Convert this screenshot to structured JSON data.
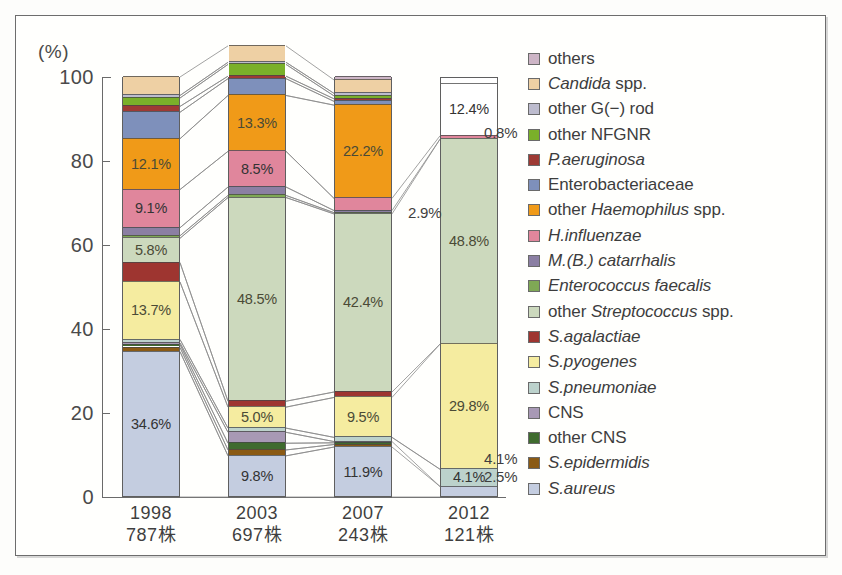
{
  "axis": {
    "unit_label": "(%)",
    "yticks": [
      "100",
      "80",
      "60",
      "40",
      "20",
      "0"
    ],
    "ymin": 0,
    "ymax": 100
  },
  "chart_data": {
    "type": "bar",
    "title": "",
    "subtitle": "",
    "xlabel": "",
    "ylabel": "(%)",
    "ylim": [
      0,
      100
    ],
    "grid": false,
    "legend_position": "right",
    "stacked": true,
    "stack_note": "100% stacked column chart; 2012 column total plotted is 87.6% with 12.4% unfilled/white area at top",
    "categories": [
      "1998",
      "2003",
      "2007",
      "2012"
    ],
    "category_sublabels": [
      "787株",
      "697株",
      "243株",
      "121株"
    ],
    "series": [
      {
        "name": "S.aureus",
        "color": "#c4cde0",
        "values": [
          34.6,
          9.8,
          11.9,
          2.5
        ],
        "labels": [
          "34.6%",
          "9.8%",
          "11.9%",
          "2.5%"
        ]
      },
      {
        "name": "S.epidermidis",
        "color": "#8a5a14",
        "values": [
          1.0,
          1.4,
          0.6,
          0.0
        ],
        "labels": [
          "",
          "",
          "",
          ""
        ]
      },
      {
        "name": "other CNS",
        "color": "#3f6b2e",
        "values": [
          0.7,
          1.6,
          0.4,
          0.0
        ],
        "labels": [
          "",
          "",
          "",
          ""
        ]
      },
      {
        "name": "CNS",
        "color": "#a899b5",
        "values": [
          0.4,
          2.6,
          0.3,
          0.0
        ],
        "labels": [
          "",
          "",
          "",
          ""
        ]
      },
      {
        "name": "S.pneumoniae",
        "color": "#bcd2cc",
        "values": [
          0.8,
          1.0,
          1.0,
          4.1
        ],
        "labels": [
          "",
          "",
          "",
          "4.1%"
        ]
      },
      {
        "name": "S.pyogenes",
        "color": "#f5eca0",
        "values": [
          13.7,
          5.0,
          9.5,
          29.8
        ],
        "labels": [
          "13.7%",
          "5.0%",
          "9.5%",
          "29.8%"
        ]
      },
      {
        "name": "S.agalactiae",
        "color": "#9e3530",
        "values": [
          4.6,
          1.4,
          1.3,
          0.0
        ],
        "labels": [
          "",
          "",
          "",
          ""
        ]
      },
      {
        "name": "other Streptococcus spp.",
        "color": "#ccd9bd",
        "values": [
          5.8,
          48.5,
          42.4,
          48.8
        ],
        "labels": [
          "5.8%",
          "48.5%",
          "42.4%",
          "48.8%"
        ]
      },
      {
        "name": "Enterococcus faecalis",
        "color": "#7fa855",
        "values": [
          0.6,
          0.5,
          0.3,
          0.0
        ],
        "labels": [
          "",
          "",
          "",
          ""
        ]
      },
      {
        "name": "M.(B.) catarrhalis",
        "color": "#8b7fa3",
        "values": [
          1.9,
          2.0,
          0.5,
          0.0
        ],
        "labels": [
          "",
          "",
          "",
          ""
        ]
      },
      {
        "name": "H.influenzae",
        "color": "#e0869c",
        "values": [
          9.1,
          8.5,
          2.9,
          0.8
        ],
        "labels": [
          "9.1%",
          "8.5%",
          "2.9%",
          "0.8%"
        ]
      },
      {
        "name": "other Haemophilus spp.",
        "color": "#f09a18",
        "values": [
          12.1,
          13.3,
          22.2,
          0.0
        ],
        "labels": [
          "12.1%",
          "13.3%",
          "22.2%",
          ""
        ]
      },
      {
        "name": "Enterobacteriaceae",
        "color": "#7e90bb",
        "values": [
          6.3,
          4.0,
          0.9,
          0.0
        ],
        "labels": [
          "",
          "",
          "",
          ""
        ]
      },
      {
        "name": "P.aeruginosa",
        "color": "#9e3a34",
        "values": [
          1.4,
          0.6,
          0.6,
          0.0
        ],
        "labels": [
          "",
          "",
          "",
          ""
        ]
      },
      {
        "name": "other NFGNR",
        "color": "#7ab02a",
        "values": [
          2.0,
          2.8,
          0.7,
          0.0
        ],
        "labels": [
          "",
          "",
          "",
          ""
        ]
      },
      {
        "name": "other G(−) rod",
        "color": "#bdbcce",
        "values": [
          0.6,
          0.5,
          0.6,
          0.0
        ],
        "labels": [
          "",
          "",
          "",
          ""
        ]
      },
      {
        "name": "Candida spp.",
        "color": "#eed0a4",
        "values": [
          4.4,
          3.9,
          3.2,
          0.0
        ],
        "labels": [
          "",
          "",
          "",
          ""
        ]
      },
      {
        "name": "others",
        "color": "#cdb5c6",
        "values": [
          0.0,
          0.0,
          0.7,
          0.0
        ],
        "labels": [
          "",
          "",
          "",
          ""
        ]
      },
      {
        "name": "unfilled",
        "color": "#ffffff",
        "values": [
          0.0,
          0.0,
          0.0,
          12.4
        ],
        "labels": [
          "",
          "",
          "",
          "12.4%"
        ]
      }
    ]
  },
  "legend": {
    "items": [
      {
        "label_plain": "others",
        "label_italic": "",
        "label_tail": "",
        "color": "#cdb5c6"
      },
      {
        "label_plain": "",
        "label_italic": "Candida",
        "label_tail": " spp.",
        "color": "#eed0a4"
      },
      {
        "label_plain": "other G(−) rod",
        "label_italic": "",
        "label_tail": "",
        "color": "#bdbcce"
      },
      {
        "label_plain": "other NFGNR",
        "label_italic": "",
        "label_tail": "",
        "color": "#7ab02a"
      },
      {
        "label_plain": "",
        "label_italic": "P.aeruginosa",
        "label_tail": "",
        "color": "#9e3a34"
      },
      {
        "label_plain": "Enterobacteriaceae",
        "label_italic": "",
        "label_tail": "",
        "color": "#7e90bb"
      },
      {
        "label_plain": "other ",
        "label_italic": "Haemophilus",
        "label_tail": " spp.",
        "color": "#f09a18"
      },
      {
        "label_plain": "",
        "label_italic": "H.influenzae",
        "label_tail": "",
        "color": "#e0869c"
      },
      {
        "label_plain": "",
        "label_italic": "M.(B.) catarrhalis",
        "label_tail": "",
        "color": "#8b7fa3"
      },
      {
        "label_plain": "",
        "label_italic": "Enterococcus faecalis",
        "label_tail": "",
        "color": "#7fa855"
      },
      {
        "label_plain": "other ",
        "label_italic": "Streptococcus",
        "label_tail": " spp.",
        "color": "#ccd9bd"
      },
      {
        "label_plain": "",
        "label_italic": "S.agalactiae",
        "label_tail": "",
        "color": "#9e3530"
      },
      {
        "label_plain": "",
        "label_italic": "S.pyogenes",
        "label_tail": "",
        "color": "#f5eca0"
      },
      {
        "label_plain": "",
        "label_italic": "S.pneumoniae",
        "label_tail": "",
        "color": "#bcd2cc"
      },
      {
        "label_plain": "CNS",
        "label_italic": "",
        "label_tail": "",
        "color": "#a899b5"
      },
      {
        "label_plain": "other CNS",
        "label_italic": "",
        "label_tail": "",
        "color": "#3f6b2e"
      },
      {
        "label_plain": "",
        "label_italic": "S.epidermidis",
        "label_tail": "",
        "color": "#8a5a14"
      },
      {
        "label_plain": "",
        "label_italic": "S.aureus",
        "label_tail": "",
        "color": "#c4cde0"
      }
    ]
  },
  "outside_labels": [
    {
      "text": "2.9%",
      "x": 392,
      "y": 188
    },
    {
      "text": "0.8%",
      "x": 468,
      "y": 108
    },
    {
      "text": "4.1%",
      "x": 468,
      "y": 434
    },
    {
      "text": "2.5%",
      "x": 468,
      "y": 452
    }
  ]
}
